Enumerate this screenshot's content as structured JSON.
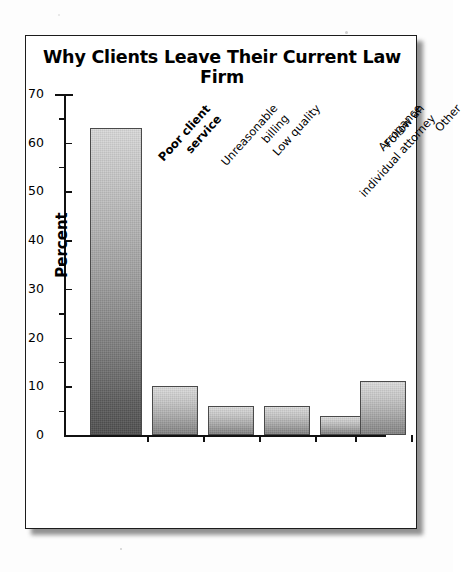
{
  "figure": {
    "title": "Why Clients Leave Their Current Law Firm"
  },
  "axes": {
    "y_title": "Percent",
    "y_ticks": [
      "70",
      "60",
      "50",
      "40",
      "30",
      "20",
      "10",
      "0"
    ]
  },
  "chart_data": {
    "type": "bar",
    "title": "Why Clients Leave Their Current Law Firm",
    "xlabel": "",
    "ylabel": "Percent",
    "ylim": [
      0,
      70
    ],
    "ytick_interval": 10,
    "yminor_tick_interval": 5,
    "grid": false,
    "legend": false,
    "orientation": "vertical",
    "bar_style": "grayscale vertical gradient, light top to dark bottom",
    "categories": [
      "Poor client service",
      "Unreasonable billing",
      "Low quality",
      "Follow an individual attorney",
      "Arrogance",
      "Other"
    ],
    "values": [
      63,
      10,
      6,
      6,
      4,
      11
    ],
    "value_unit": "percent",
    "emphasized_category": "Poor client service"
  },
  "categories": [
    {
      "line1": "Poor client",
      "line2": "service",
      "emphasis": true
    },
    {
      "line1": "Unreasonable",
      "line2": "billing",
      "emphasis": false
    },
    {
      "line1": "Low quality",
      "line2": "",
      "emphasis": false
    },
    {
      "line1": "Follow an",
      "line2": "individual attorney",
      "emphasis": false
    },
    {
      "line1": "Arrogance",
      "line2": "",
      "emphasis": false
    },
    {
      "line1": "Other",
      "line2": "",
      "emphasis": false
    }
  ]
}
